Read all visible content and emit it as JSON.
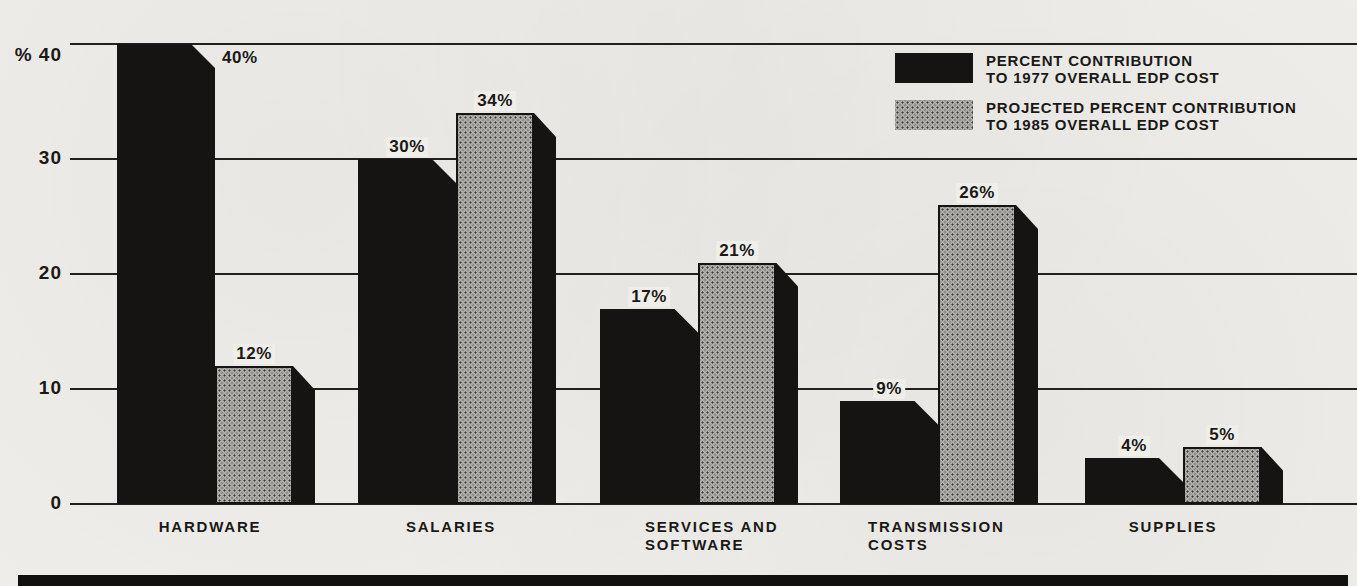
{
  "chart_data": {
    "type": "bar",
    "categories": [
      "HARDWARE",
      "SALARIES",
      "SERVICES AND SOFTWARE",
      "TRANSMISSION COSTS",
      "SUPPLIES"
    ],
    "category_lines": [
      [
        "HARDWARE"
      ],
      [
        "SALARIES"
      ],
      [
        "SERVICES AND",
        "SOFTWARE"
      ],
      [
        "TRANSMISSION",
        "COSTS"
      ],
      [
        "SUPPLIES"
      ]
    ],
    "series": [
      {
        "name": "PERCENT CONTRIBUTION TO 1977 OVERALL EDP COST",
        "values": [
          40,
          30,
          17,
          9,
          4
        ],
        "labels": [
          "40%",
          "30%",
          "17%",
          "9%",
          "4%"
        ],
        "color": "#161412"
      },
      {
        "name": "PROJECTED PERCENT CONTRIBUTION TO 1985 OVERALL EDP COST",
        "values": [
          12,
          34,
          21,
          26,
          5
        ],
        "labels": [
          "12%",
          "34%",
          "21%",
          "26%",
          "5%"
        ],
        "color": "#b2b0ac"
      }
    ],
    "ylabel": "%",
    "ylim": [
      0,
      40
    ],
    "yticks": [
      40,
      30,
      20,
      10,
      0
    ],
    "ytick_labels": [
      "% 40",
      "30",
      "20",
      "10",
      "0"
    ],
    "grid": true,
    "legend_position": "top-right",
    "bar_style": "3d-chamfered-shadow"
  },
  "legend": {
    "items": [
      {
        "line1": "PERCENT CONTRIBUTION",
        "line2": "TO 1977 OVERALL EDP COST",
        "swatch": "black"
      },
      {
        "line1": "PROJECTED PERCENT CONTRIBUTION",
        "line2": "TO 1985 OVERALL EDP COST",
        "swatch": "gray"
      }
    ]
  },
  "colors": {
    "paper": "#efeeea",
    "ink": "#161412",
    "bar_gray": "#b2b0ac",
    "grid": "#23211f"
  }
}
